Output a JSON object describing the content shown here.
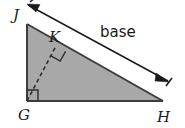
{
  "figure": {
    "type": "geometry-diagram",
    "background_color": "#ffffff",
    "fill_color": "#a8a8a8",
    "stroke_color": "#3c3c3c",
    "label_color": "#1a1a1a",
    "vertices": [
      {
        "name": "J",
        "label": "J",
        "x": 27,
        "y": 24,
        "label_x": 13,
        "label_y": 20
      },
      {
        "name": "G",
        "label": "G",
        "x": 27,
        "y": 101,
        "label_x": 18,
        "label_y": 120
      },
      {
        "name": "H",
        "label": "H",
        "x": 163,
        "y": 101,
        "label_x": 157,
        "label_y": 122
      },
      {
        "name": "K",
        "label": "K",
        "x": 56,
        "y": 46,
        "label_x": 49,
        "label_y": 42
      }
    ],
    "segments": [
      {
        "name": "leg-JG",
        "from": "J",
        "to": "G",
        "style": "solid"
      },
      {
        "name": "leg-GH",
        "from": "G",
        "to": "H",
        "style": "solid"
      },
      {
        "name": "hypotenuse-JH",
        "from": "J",
        "to": "H",
        "style": "solid"
      },
      {
        "name": "altitude-GK",
        "from": "G",
        "to": "K",
        "style": "dashed"
      }
    ],
    "right_angles": [
      {
        "name": "right-angle-at-G",
        "vertex": "G"
      },
      {
        "name": "right-angle-at-K",
        "vertex": "K"
      }
    ],
    "measure": {
      "name": "base",
      "label": "base",
      "label_x": 100,
      "label_y": 37,
      "arrow_start_x": 28,
      "arrow_start_y": 5,
      "arrow_end_x": 168,
      "arrow_end_y": 81,
      "double_headed": true
    }
  }
}
